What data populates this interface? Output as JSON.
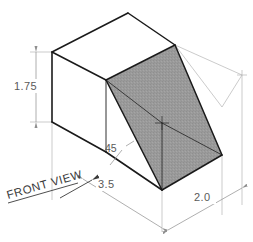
{
  "drawing": {
    "title": "Isometric view of a rectangular block with 45 degree inclined cut",
    "background_color": "#ffffff",
    "object_line_color": "#1a1a1a",
    "dimension_line_color": "#9b9b9b",
    "shaded_face_color": "#9a9a9a",
    "unshaded_face_color": "#ffffff",
    "text_color": "#5a5a5a"
  },
  "dimensions": {
    "height": {
      "label": "1.75",
      "name": "height-dimension",
      "orientation": "vertical",
      "side": "left"
    },
    "length": {
      "label": "3.5",
      "name": "length-dimension",
      "orientation": "isometric-left",
      "side": "bottom-left"
    },
    "depth": {
      "label": "2.0",
      "name": "depth-dimension",
      "orientation": "isometric-right",
      "side": "bottom-right"
    },
    "angle": {
      "label": "45",
      "name": "angle-callout",
      "leader": "points to inclined face"
    }
  },
  "annotations": {
    "view_label": {
      "label": "FRONT VIEW",
      "name": "front-view-label",
      "arrow_direction": "up-right",
      "underlined": true
    }
  },
  "faces": [
    {
      "name": "top-face",
      "shaded": false,
      "fill": "#ffffff"
    },
    {
      "name": "left-side-face",
      "shaded": false,
      "fill": "#ffffff"
    },
    {
      "name": "front-lower-face",
      "shaded": false,
      "fill": "#ffffff"
    },
    {
      "name": "inclined-cut-face",
      "shaded": true,
      "fill": "#9a9a9a"
    }
  ]
}
